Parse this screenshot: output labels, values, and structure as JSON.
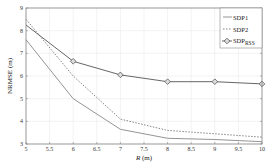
{
  "chart_data": {
    "type": "line",
    "title": "",
    "xlabel": "R (m)",
    "ylabel": "NRMSE (m)",
    "xlim": [
      5,
      10
    ],
    "ylim": [
      3,
      9
    ],
    "grid": true,
    "legend_position": "upper right",
    "x_ticks": [
      "5",
      "5.5",
      "6",
      "6.5",
      "7",
      "7.5",
      "8",
      "8.5",
      "9",
      "9.5",
      "10"
    ],
    "y_ticks": [
      "3",
      "4",
      "5",
      "6",
      "7",
      "8",
      "9"
    ],
    "x": [
      5,
      6,
      7,
      8,
      9,
      10
    ],
    "series": [
      {
        "name": "SDP1",
        "style": "solid",
        "marker": "none",
        "color": "#888888",
        "values": [
          7.6,
          5.0,
          3.65,
          3.25,
          3.2,
          3.1
        ]
      },
      {
        "name": "SDP2",
        "style": "dashed",
        "marker": "none",
        "color": "#777777",
        "values": [
          8.5,
          6.0,
          4.1,
          3.6,
          3.45,
          3.3
        ]
      },
      {
        "name": "SDP_RSS",
        "style": "solid",
        "marker": "diamond",
        "color": "#555555",
        "values": [
          8.25,
          6.65,
          6.05,
          5.75,
          5.75,
          5.65
        ]
      }
    ]
  },
  "legend": {
    "sdp1": "SDP1",
    "sdp2": "SDP2",
    "sdp_rss_base": "SDP",
    "sdp_rss_sub": "RSS"
  },
  "axes": {
    "xlabel_italic": "R",
    "xlabel_unit": " (m)",
    "ylabel": "NRMSE (m)"
  }
}
